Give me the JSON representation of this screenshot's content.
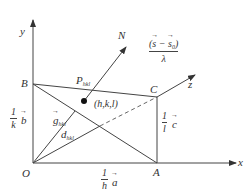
{
  "diagram": {
    "axes": {
      "x_label": "x",
      "y_label": "y",
      "z_label": "z",
      "origin_label": "O"
    },
    "points": {
      "A": "A",
      "B": "B",
      "C": "C"
    },
    "plane_label": {
      "main": "P",
      "sub": "hkl"
    },
    "normal_label": "N",
    "node_label": "(h,k,l)",
    "vector_g": {
      "main": "g",
      "sub": "hkl"
    },
    "spacing_d": {
      "main": "d",
      "sub": "hkl"
    },
    "intercepts": {
      "a": {
        "num": "1",
        "den": "h",
        "vec": "a"
      },
      "b": {
        "num": "1",
        "den": "k",
        "vec": "b"
      },
      "c": {
        "num": "1",
        "den": "l",
        "vec": "c"
      }
    },
    "scattering_fraction": {
      "numerator": "(s − s₀)",
      "s": "s",
      "s0": "s",
      "s0_sub": "0",
      "minus": " − ",
      "denominator": "λ"
    },
    "colors": {
      "line": "#444444",
      "background": "#ffffff"
    }
  }
}
